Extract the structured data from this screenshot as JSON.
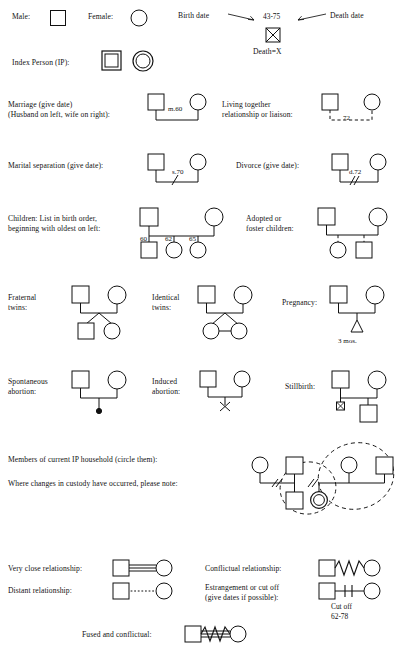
{
  "rows": {
    "male": "Male:",
    "female": "Female:",
    "birth_date": "Birth date",
    "death_date": "Death date",
    "life_span": "43-75",
    "death_equals": "Death=X",
    "index_person": "Index Person (IP):",
    "marriage_l1": "Marriage (give date)",
    "marriage_l2": "(Husband on left, wife on right):",
    "marriage_code": "m.60",
    "living_together_l1": "Living together",
    "living_together_l2": "relationship or liaison:",
    "living_together_code": "72",
    "separation": "Marital separation (give date):",
    "separation_code": "s.70",
    "divorce": "Divorce (give date):",
    "divorce_code": "d.72",
    "children_l1": "Children: List in birth order,",
    "children_l2": "beginning with oldest on left:",
    "child_years": [
      "60",
      "62",
      "65"
    ],
    "adopted_l1": "Adopted or",
    "adopted_l2": "foster children:",
    "fraternal_l1": "Fraternal",
    "fraternal_l2": "twins:",
    "identical_l1": "Identical",
    "identical_l2": "twins:",
    "pregnancy": "Pregnancy:",
    "pregnancy_months": "3 mos.",
    "spontaneous_l1": "Spontaneous",
    "spontaneous_l2": "abortion:",
    "induced_l1": "Induced",
    "induced_l2": "abortion:",
    "stillbirth": "Stillbirth:",
    "household": "Members of current IP household (circle them):",
    "custody": "Where changes in custody have occurred, please note:",
    "very_close": "Very close relationship:",
    "distant": "Distant relationship:",
    "conflictual": "Conflictual relationship:",
    "estrangement_l1": "Estrangement or cut off",
    "estrangement_l2": "(give dates if possible):",
    "cut_off_l1": "Cut off",
    "cut_off_l2": "62-78",
    "fused": "Fused and conflictual:"
  },
  "colors": {
    "ink": "#111111",
    "paper": "#ffffff"
  }
}
